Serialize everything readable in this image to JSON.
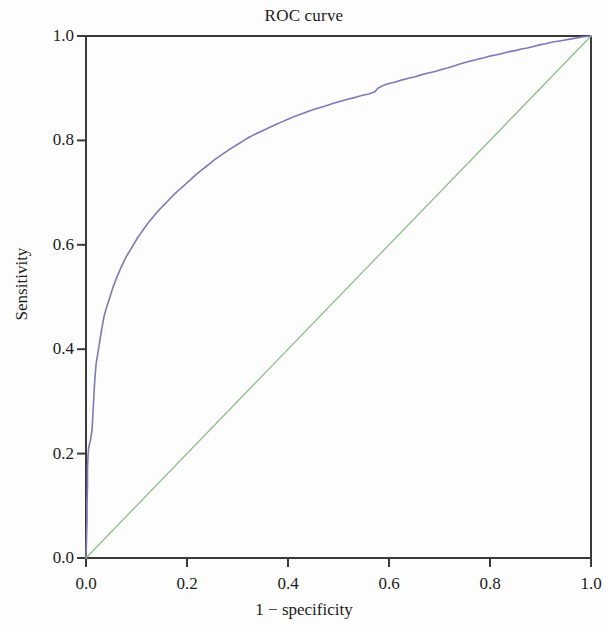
{
  "chart_data": {
    "type": "line",
    "title": "ROC curve",
    "xlabel": "1 − specificity",
    "ylabel": "Sensitivity",
    "xlim": [
      0.0,
      1.0
    ],
    "ylim": [
      0.0,
      1.0
    ],
    "grid": false,
    "legend": null,
    "xticks": [
      "0.0",
      "0.2",
      "0.4",
      "0.6",
      "0.8",
      "1.0"
    ],
    "xtick_values": [
      0.0,
      0.2,
      0.4,
      0.6,
      0.8,
      1.0
    ],
    "yticks": [
      "0.0",
      "0.2",
      "0.4",
      "0.6",
      "0.8",
      "1.0"
    ],
    "ytick_values": [
      0.0,
      0.2,
      0.4,
      0.6,
      0.8,
      1.0
    ],
    "series": [
      {
        "name": "ROC curve",
        "color": "#7b7bb5",
        "linewidth": 1.6,
        "points": [
          [
            0.0,
            0.0
          ],
          [
            0.001,
            0.035
          ],
          [
            0.002,
            0.072
          ],
          [
            0.002,
            0.105
          ],
          [
            0.003,
            0.14
          ],
          [
            0.003,
            0.172
          ],
          [
            0.004,
            0.196
          ],
          [
            0.005,
            0.208
          ],
          [
            0.006,
            0.215
          ],
          [
            0.008,
            0.222
          ],
          [
            0.01,
            0.232
          ],
          [
            0.012,
            0.246
          ],
          [
            0.013,
            0.262
          ],
          [
            0.014,
            0.281
          ],
          [
            0.015,
            0.3
          ],
          [
            0.016,
            0.318
          ],
          [
            0.017,
            0.334
          ],
          [
            0.018,
            0.348
          ],
          [
            0.019,
            0.36
          ],
          [
            0.02,
            0.372
          ],
          [
            0.022,
            0.384
          ],
          [
            0.024,
            0.396
          ],
          [
            0.026,
            0.408
          ],
          [
            0.028,
            0.42
          ],
          [
            0.03,
            0.432
          ],
          [
            0.032,
            0.443
          ],
          [
            0.034,
            0.454
          ],
          [
            0.036,
            0.464
          ],
          [
            0.039,
            0.474
          ],
          [
            0.042,
            0.484
          ],
          [
            0.045,
            0.493
          ],
          [
            0.048,
            0.502
          ],
          [
            0.051,
            0.511
          ],
          [
            0.054,
            0.52
          ],
          [
            0.058,
            0.53
          ],
          [
            0.062,
            0.54
          ],
          [
            0.066,
            0.549
          ],
          [
            0.07,
            0.558
          ],
          [
            0.074,
            0.566
          ],
          [
            0.078,
            0.574
          ],
          [
            0.082,
            0.581
          ],
          [
            0.087,
            0.589
          ],
          [
            0.092,
            0.597
          ],
          [
            0.097,
            0.605
          ],
          [
            0.102,
            0.613
          ],
          [
            0.107,
            0.62
          ],
          [
            0.112,
            0.627
          ],
          [
            0.118,
            0.635
          ],
          [
            0.124,
            0.643
          ],
          [
            0.13,
            0.65
          ],
          [
            0.136,
            0.657
          ],
          [
            0.142,
            0.664
          ],
          [
            0.148,
            0.67
          ],
          [
            0.155,
            0.677
          ],
          [
            0.162,
            0.684
          ],
          [
            0.169,
            0.691
          ],
          [
            0.176,
            0.698
          ],
          [
            0.183,
            0.704
          ],
          [
            0.19,
            0.71
          ],
          [
            0.198,
            0.717
          ],
          [
            0.206,
            0.724
          ],
          [
            0.214,
            0.731
          ],
          [
            0.222,
            0.738
          ],
          [
            0.23,
            0.744
          ],
          [
            0.238,
            0.75
          ],
          [
            0.247,
            0.757
          ],
          [
            0.256,
            0.764
          ],
          [
            0.265,
            0.77
          ],
          [
            0.274,
            0.776
          ],
          [
            0.283,
            0.782
          ],
          [
            0.293,
            0.788
          ],
          [
            0.303,
            0.794
          ],
          [
            0.313,
            0.8
          ],
          [
            0.323,
            0.806
          ],
          [
            0.333,
            0.811
          ],
          [
            0.344,
            0.816
          ],
          [
            0.355,
            0.821
          ],
          [
            0.366,
            0.826
          ],
          [
            0.377,
            0.831
          ],
          [
            0.389,
            0.836
          ],
          [
            0.401,
            0.841
          ],
          [
            0.413,
            0.846
          ],
          [
            0.425,
            0.85
          ],
          [
            0.438,
            0.855
          ],
          [
            0.451,
            0.859
          ],
          [
            0.464,
            0.863
          ],
          [
            0.477,
            0.867
          ],
          [
            0.49,
            0.871
          ],
          [
            0.504,
            0.875
          ],
          [
            0.518,
            0.879
          ],
          [
            0.532,
            0.882
          ],
          [
            0.546,
            0.886
          ],
          [
            0.56,
            0.889
          ],
          [
            0.572,
            0.893
          ],
          [
            0.578,
            0.9
          ],
          [
            0.588,
            0.905
          ],
          [
            0.6,
            0.909
          ],
          [
            0.613,
            0.912
          ],
          [
            0.626,
            0.916
          ],
          [
            0.639,
            0.919
          ],
          [
            0.652,
            0.922
          ],
          [
            0.665,
            0.926
          ],
          [
            0.678,
            0.929
          ],
          [
            0.691,
            0.932
          ],
          [
            0.704,
            0.936
          ],
          [
            0.717,
            0.939
          ],
          [
            0.73,
            0.943
          ],
          [
            0.742,
            0.947
          ],
          [
            0.754,
            0.95
          ],
          [
            0.766,
            0.953
          ],
          [
            0.778,
            0.956
          ],
          [
            0.79,
            0.959
          ],
          [
            0.802,
            0.962
          ],
          [
            0.814,
            0.964
          ],
          [
            0.826,
            0.967
          ],
          [
            0.838,
            0.97
          ],
          [
            0.85,
            0.972
          ],
          [
            0.862,
            0.975
          ],
          [
            0.874,
            0.977
          ],
          [
            0.886,
            0.98
          ],
          [
            0.898,
            0.983
          ],
          [
            0.91,
            0.985
          ],
          [
            0.922,
            0.988
          ],
          [
            0.934,
            0.99
          ],
          [
            0.946,
            0.992
          ],
          [
            0.958,
            0.994
          ],
          [
            0.97,
            0.996
          ],
          [
            0.982,
            0.998
          ],
          [
            0.991,
            0.999
          ],
          [
            1.0,
            1.0
          ]
        ]
      },
      {
        "name": "reference diagonal",
        "color": "#8cc08c",
        "linewidth": 1.3,
        "points": [
          [
            0.0,
            0.0
          ],
          [
            1.0,
            1.0
          ]
        ]
      }
    ]
  },
  "axes": {
    "axis_color": "#3a3a3a",
    "background": "#fdfdfd"
  }
}
